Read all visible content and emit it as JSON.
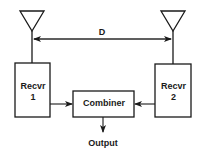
{
  "diagram": {
    "distance_label": "D",
    "nodes": [
      {
        "id": "antenna1",
        "label": ""
      },
      {
        "id": "antenna2",
        "label": ""
      },
      {
        "id": "recvr1",
        "label_line1": "Recvr",
        "label_line2": "1"
      },
      {
        "id": "recvr2",
        "label_line1": "Recvr",
        "label_line2": "2"
      },
      {
        "id": "combiner",
        "label": "Combiner"
      }
    ],
    "output_label": "Output",
    "edges": [
      {
        "from": "antenna1",
        "to": "recvr1"
      },
      {
        "from": "antenna2",
        "to": "recvr2"
      },
      {
        "from": "recvr1",
        "to": "combiner"
      },
      {
        "from": "recvr2",
        "to": "combiner"
      },
      {
        "from": "combiner",
        "to": "output"
      }
    ]
  }
}
